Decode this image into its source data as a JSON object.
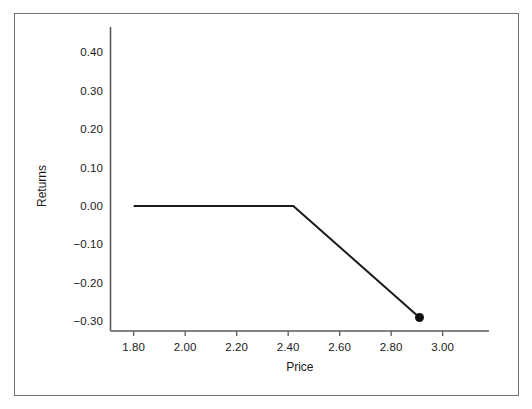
{
  "chart_data": {
    "type": "line",
    "title": "",
    "subtitle": "",
    "xlabel": "Price",
    "ylabel": "Returns",
    "xlim": [
      1.71,
      3.18
    ],
    "ylim": [
      -0.325,
      0.465
    ],
    "grid": false,
    "legend": null,
    "x_ticks": [
      "1.80",
      "2.00",
      "2.20",
      "2.40",
      "2.60",
      "2.80",
      "3.00"
    ],
    "x_tick_values": [
      1.8,
      2.0,
      2.2,
      2.4,
      2.6,
      2.8,
      3.0
    ],
    "y_ticks": [
      "0.40",
      "0.30",
      "0.20",
      "0.10",
      "0.00",
      "-0.10",
      "-0.20",
      "-0.30"
    ],
    "y_tick_values": [
      0.4,
      0.3,
      0.2,
      0.1,
      0.0,
      -0.1,
      -0.2,
      -0.3
    ],
    "series": [
      {
        "name": "Returns",
        "color": "#1a1a1a",
        "line_width": 2,
        "x": [
          1.8,
          2.42,
          2.91
        ],
        "y": [
          0.0,
          0.0,
          -0.29
        ]
      }
    ],
    "markers": [
      {
        "name": "endpoint-marker",
        "x": 2.91,
        "y": -0.29,
        "shape": "filled-circle",
        "color": "#111111",
        "radius": 4.5
      }
    ],
    "annotations": []
  },
  "axes": {
    "x_axis_color": "#5a5a5a",
    "y_axis_color": "#5a5a5a",
    "tick_color": "#5a5a5a",
    "text_color": "#1a1a1a"
  },
  "figure": {
    "background": "#ffffff",
    "border_color": "#6f6f6f"
  }
}
